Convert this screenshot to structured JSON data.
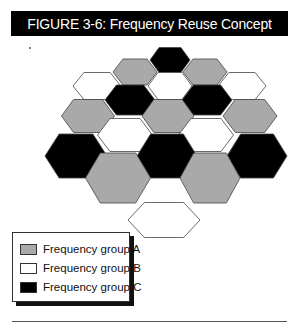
{
  "figure": {
    "title": "FIGURE 3-6: Frequency Reuse Concept"
  },
  "colors": {
    "group_a": "#a9a9a9",
    "group_b": "#ffffff",
    "group_c": "#000000",
    "outline": "#444444"
  },
  "hexagons": [
    {
      "cx": 170,
      "cy": 60,
      "w": 40,
      "h": 25,
      "group": "C"
    },
    {
      "cx": 135,
      "cy": 72,
      "w": 44,
      "h": 26,
      "group": "A"
    },
    {
      "cx": 205,
      "cy": 72,
      "w": 44,
      "h": 26,
      "group": "A"
    },
    {
      "cx": 97,
      "cy": 86,
      "w": 48,
      "h": 27,
      "group": "B"
    },
    {
      "cx": 170,
      "cy": 86,
      "w": 44,
      "h": 27,
      "group": "B"
    },
    {
      "cx": 242,
      "cy": 86,
      "w": 48,
      "h": 27,
      "group": "B"
    },
    {
      "cx": 130,
      "cy": 100,
      "w": 50,
      "h": 30,
      "group": "C"
    },
    {
      "cx": 207,
      "cy": 100,
      "w": 50,
      "h": 30,
      "group": "C"
    },
    {
      "cx": 88,
      "cy": 116,
      "w": 53,
      "h": 33,
      "group": "A"
    },
    {
      "cx": 168,
      "cy": 116,
      "w": 52,
      "h": 33,
      "group": "A"
    },
    {
      "cx": 250,
      "cy": 116,
      "w": 54,
      "h": 33,
      "group": "A"
    },
    {
      "cx": 125,
      "cy": 135,
      "w": 55,
      "h": 33,
      "group": "B"
    },
    {
      "cx": 206,
      "cy": 135,
      "w": 55,
      "h": 33,
      "group": "B"
    },
    {
      "cx": 76,
      "cy": 156,
      "w": 62,
      "h": 44,
      "group": "C"
    },
    {
      "cx": 167,
      "cy": 156,
      "w": 60,
      "h": 44,
      "group": "C"
    },
    {
      "cx": 257,
      "cy": 156,
      "w": 60,
      "h": 44,
      "group": "C"
    },
    {
      "cx": 118,
      "cy": 178,
      "w": 65,
      "h": 50,
      "group": "A"
    },
    {
      "cx": 210,
      "cy": 178,
      "w": 60,
      "h": 50,
      "group": "A"
    },
    {
      "cx": 164,
      "cy": 220,
      "w": 72,
      "h": 35,
      "group": "B"
    }
  ],
  "legend": {
    "items": [
      {
        "label": "Frequency group A",
        "group": "A",
        "color": "#a9a9a9"
      },
      {
        "label": "Frequency group B",
        "group": "B",
        "color": "#ffffff"
      },
      {
        "label": "Frequency group C",
        "group": "C",
        "color": "#000000"
      }
    ]
  }
}
